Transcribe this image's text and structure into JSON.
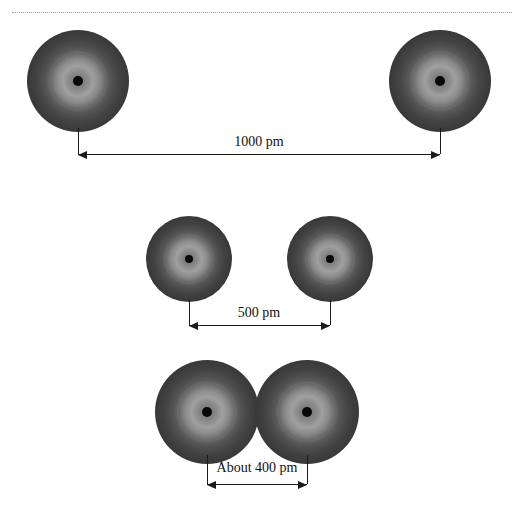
{
  "figure": {
    "background_color": "#ffffff",
    "divider": {
      "style": "dotted",
      "color": "#9a9a9a"
    },
    "atom_colors": {
      "edge": "#272727",
      "shell_bright": "#a0a0a0",
      "nucleus": "#080808",
      "line": "#1a1a1a"
    },
    "rows": [
      {
        "id": "row-far",
        "label": "1000 pm",
        "distance_value": 1000,
        "distance_unit": "pm",
        "atoms": [
          {
            "cx": 78,
            "cy": 81,
            "r": 51
          },
          {
            "cx": 440,
            "cy": 81,
            "r": 51
          }
        ],
        "leader_top": 128,
        "leader_bottom": 154,
        "dim_y": 154,
        "dim_left": 78,
        "dim_right": 440,
        "label_x": 259,
        "label_y": 135
      },
      {
        "id": "row-mid",
        "label": "500 pm",
        "distance_value": 500,
        "distance_unit": "pm",
        "atoms": [
          {
            "cx": 189,
            "cy": 259,
            "r": 43
          },
          {
            "cx": 330,
            "cy": 259,
            "r": 43
          }
        ],
        "leader_top": 300,
        "leader_bottom": 325,
        "dim_y": 325,
        "dim_left": 189,
        "dim_right": 330,
        "label_x": 259,
        "label_y": 306
      },
      {
        "id": "row-near",
        "label": "About 400 pm",
        "distance_value": 400,
        "distance_unit": "pm",
        "distance_qualifier": "About",
        "atoms": [
          {
            "cx": 207,
            "cy": 412,
            "r": 52
          },
          {
            "cx": 307,
            "cy": 412,
            "r": 52
          }
        ],
        "leader_top": 455,
        "leader_bottom": 484,
        "dim_y": 484,
        "dim_left": 207,
        "dim_right": 307,
        "label_x": 257,
        "label_y": 461
      }
    ]
  }
}
